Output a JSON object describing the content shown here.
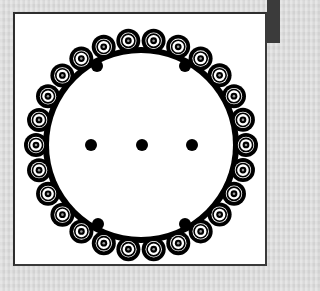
{
  "figure": {
    "type": "circular-bead-pattern",
    "background_color": "#dedede",
    "frame": {
      "x": 13,
      "y": 12,
      "width": 254,
      "height": 254,
      "fill": "#ffffff",
      "stroke": "#2e2e2e"
    },
    "corner_bar": {
      "color": "#3b3b3b"
    },
    "ring": {
      "center_x": 141,
      "center_y": 145,
      "bead_radius_path": 105,
      "bead_count": 26,
      "angle_offset_deg": 6.9,
      "band_radius": 95,
      "band_width": 6,
      "bead_outer_radius": 12,
      "ink_color": "#000000",
      "paper_color": "#ffffff"
    },
    "dots": [
      {
        "name": "dot-upper-left",
        "x": 97,
        "y": 66,
        "r": 6
      },
      {
        "name": "dot-upper-right",
        "x": 185,
        "y": 66,
        "r": 6
      },
      {
        "name": "dot-middle-left",
        "x": 91,
        "y": 145,
        "r": 6
      },
      {
        "name": "dot-center",
        "x": 142,
        "y": 145,
        "r": 6
      },
      {
        "name": "dot-middle-right",
        "x": 192,
        "y": 145,
        "r": 6
      },
      {
        "name": "dot-lower-left",
        "x": 98,
        "y": 224,
        "r": 6
      },
      {
        "name": "dot-lower-right",
        "x": 185,
        "y": 224,
        "r": 6
      }
    ]
  }
}
